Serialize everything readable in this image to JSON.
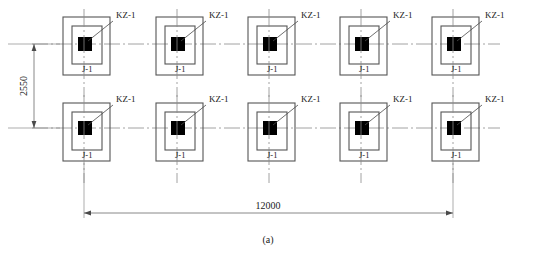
{
  "drawing": {
    "caption": "(a)",
    "dimensions": {
      "horizontal": {
        "label": "12000",
        "name": "overall-span-dimension"
      },
      "vertical": {
        "label": "2550",
        "name": "row-spacing-dimension"
      }
    },
    "column_label": "KZ-1",
    "footing_label": "J-1",
    "grid": {
      "columns": 5,
      "rows": 2,
      "column_centers_x": [
        84,
        177,
        269,
        361,
        453
      ],
      "row_centers_y": [
        44,
        128
      ]
    },
    "units": [
      {
        "id": "unit-r1-c1",
        "row": 1,
        "col": 1,
        "cx": 84,
        "cy": 44,
        "column_label": "KZ-1",
        "footing_label": "J-1"
      },
      {
        "id": "unit-r1-c2",
        "row": 1,
        "col": 2,
        "cx": 177,
        "cy": 44,
        "column_label": "KZ-1",
        "footing_label": "J-1"
      },
      {
        "id": "unit-r1-c3",
        "row": 1,
        "col": 3,
        "cx": 269,
        "cy": 44,
        "column_label": "KZ-1",
        "footing_label": "J-1"
      },
      {
        "id": "unit-r1-c4",
        "row": 1,
        "col": 4,
        "cx": 361,
        "cy": 44,
        "column_label": "KZ-1",
        "footing_label": "J-1"
      },
      {
        "id": "unit-r1-c5",
        "row": 1,
        "col": 5,
        "cx": 453,
        "cy": 44,
        "column_label": "KZ-1",
        "footing_label": "J-1"
      },
      {
        "id": "unit-r2-c1",
        "row": 2,
        "col": 1,
        "cx": 84,
        "cy": 128,
        "column_label": "KZ-1",
        "footing_label": "J-1"
      },
      {
        "id": "unit-r2-c2",
        "row": 2,
        "col": 2,
        "cx": 177,
        "cy": 128,
        "column_label": "KZ-1",
        "footing_label": "J-1"
      },
      {
        "id": "unit-r2-c3",
        "row": 2,
        "col": 3,
        "cx": 269,
        "cy": 128,
        "column_label": "KZ-1",
        "footing_label": "J-1"
      },
      {
        "id": "unit-r2-c4",
        "row": 2,
        "col": 4,
        "cx": 361,
        "cy": 128,
        "column_label": "KZ-1",
        "footing_label": "J-1"
      },
      {
        "id": "unit-r2-c5",
        "row": 2,
        "col": 5,
        "cx": 453,
        "cy": 128,
        "column_label": "KZ-1",
        "footing_label": "J-1"
      }
    ],
    "colors": {
      "line": "#4a4a4a",
      "outline": "#555555",
      "column_fill": "#000000",
      "centerline": "#8a8a8a",
      "text": "#1a1a1a",
      "background": "#ffffff"
    }
  }
}
